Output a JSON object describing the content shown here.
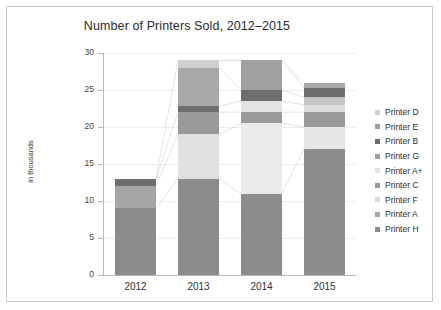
{
  "chart_data": {
    "type": "bar",
    "stacked": true,
    "title": "Number of Printers Sold, 2012–2015",
    "xlabel": "",
    "ylabel": "in thousands",
    "categories": [
      "2012",
      "2013",
      "2014",
      "2015"
    ],
    "ylim": [
      0,
      30
    ],
    "yticks": [
      0,
      5,
      10,
      15,
      20,
      25,
      30
    ],
    "grid": true,
    "legend_position": "right",
    "legend_order": [
      "Printer D",
      "Printer E",
      "Printer B",
      "Printer G",
      "Printer A+",
      "Printer C",
      "Printer F",
      "Printer A",
      "Printer H"
    ],
    "series": [
      {
        "name": "Printer H",
        "color": "#8c8c8c",
        "values": [
          9.0,
          13.0,
          11.0,
          17.0
        ]
      },
      {
        "name": "Printer A",
        "color": "#a6a6a6",
        "values": [
          3.0,
          6.0,
          9.5,
          3.0
        ]
      },
      {
        "name": "Printer F",
        "color": "#d9d9d9",
        "values": [
          0.0,
          0.0,
          0.0,
          0.0
        ]
      },
      {
        "name": "Printer C",
        "color": "#9a9a9a",
        "values": [
          0.0,
          3.0,
          1.5,
          2.0
        ]
      },
      {
        "name": "Printer A+",
        "color": "#e3e3e3",
        "values": [
          0.0,
          0.0,
          1.5,
          1.0
        ]
      },
      {
        "name": "Printer G",
        "color": "#a0a0a0",
        "values": [
          0.0,
          0.0,
          0.0,
          1.0
        ]
      },
      {
        "name": "Printer B",
        "color": "#6e6e6e",
        "values": [
          1.0,
          0.8,
          1.5,
          1.3
        ]
      },
      {
        "name": "Printer E",
        "color": "#9e9e9e",
        "values": [
          0.0,
          5.2,
          4.0,
          0.3
        ]
      },
      {
        "name": "Printer D",
        "color": "#d0d0d0",
        "values": [
          0.0,
          1.0,
          0.0,
          0.4
        ]
      }
    ],
    "totals": [
      13.0,
      29.0,
      29.0,
      26.0
    ]
  },
  "legend": {
    "items": [
      {
        "label": "Printer D",
        "color": "#d0d0d0"
      },
      {
        "label": "Printer E",
        "color": "#9e9e9e"
      },
      {
        "label": "Printer B",
        "color": "#6e6e6e"
      },
      {
        "label": "Printer G",
        "color": "#a0a0a0"
      },
      {
        "label": "Printer A+",
        "color": "#e3e3e3"
      },
      {
        "label": "Printer C",
        "color": "#9a9a9a"
      },
      {
        "label": "Printer F",
        "color": "#d9d9d9"
      },
      {
        "label": "Printer A",
        "color": "#a6a6a6"
      },
      {
        "label": "Printer H",
        "color": "#8c8c8c"
      }
    ]
  },
  "stacks": [
    {
      "year": "2012",
      "segments": [
        {
          "series": "Printer H",
          "value": 9.0,
          "color": "#8c8c8c"
        },
        {
          "series": "Printer A",
          "value": 3.0,
          "color": "#a6a6a6"
        },
        {
          "series": "Printer B",
          "value": 1.0,
          "color": "#6e6e6e"
        }
      ]
    },
    {
      "year": "2013",
      "segments": [
        {
          "series": "Printer H",
          "value": 13.0,
          "color": "#8c8c8c"
        },
        {
          "series": "Printer A",
          "value": 6.0,
          "color": "#e0e0e0"
        },
        {
          "series": "Printer C",
          "value": 3.0,
          "color": "#9a9a9a"
        },
        {
          "series": "Printer B",
          "value": 0.8,
          "color": "#6e6e6e"
        },
        {
          "series": "Printer E",
          "value": 5.2,
          "color": "#a8a8a8"
        },
        {
          "series": "Printer D",
          "value": 1.0,
          "color": "#d0d0d0"
        }
      ]
    },
    {
      "year": "2014",
      "segments": [
        {
          "series": "Printer H",
          "value": 11.0,
          "color": "#8c8c8c"
        },
        {
          "series": "Printer A",
          "value": 9.5,
          "color": "#ebebeb"
        },
        {
          "series": "Printer C",
          "value": 1.5,
          "color": "#9a9a9a"
        },
        {
          "series": "Printer A+",
          "value": 1.5,
          "color": "#e3e3e3"
        },
        {
          "series": "Printer B",
          "value": 1.5,
          "color": "#6e6e6e"
        },
        {
          "series": "Printer E",
          "value": 4.0,
          "color": "#a0a0a0"
        }
      ]
    },
    {
      "year": "2015",
      "segments": [
        {
          "series": "Printer H",
          "value": 17.0,
          "color": "#8c8c8c"
        },
        {
          "series": "Printer A",
          "value": 3.0,
          "color": "#e6e6e6"
        },
        {
          "series": "Printer C",
          "value": 2.0,
          "color": "#9a9a9a"
        },
        {
          "series": "Printer A+",
          "value": 1.0,
          "color": "#dcdcdc"
        },
        {
          "series": "Printer G",
          "value": 1.0,
          "color": "#c4c4c4"
        },
        {
          "series": "Printer B",
          "value": 1.3,
          "color": "#6e6e6e"
        },
        {
          "series": "Printer E",
          "value": 0.7,
          "color": "#a8a8a8"
        }
      ]
    }
  ]
}
